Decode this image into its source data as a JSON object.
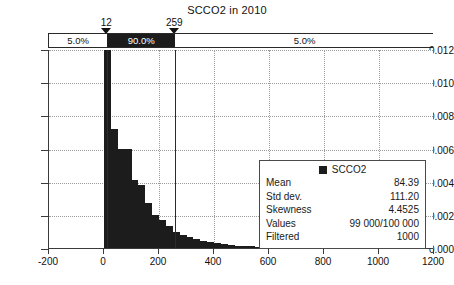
{
  "chart_data": {
    "type": "bar",
    "title": "SCCO2 in 2010",
    "xlabel": "",
    "ylabel": "",
    "xlim": [
      -200,
      1200
    ],
    "ylim": [
      0.0,
      0.012
    ],
    "grid": true,
    "legend_position": "inside-right",
    "x_ticks": [
      "-200",
      "0",
      "200",
      "400",
      "600",
      "800",
      "1000",
      "1200"
    ],
    "x_tick_values": [
      -200,
      0,
      200,
      400,
      600,
      800,
      1000,
      1200
    ],
    "y_ticks": [
      "0.000",
      "0.002",
      "0.004",
      "0.006",
      "0.008",
      "0.010",
      "0.012"
    ],
    "y_tick_values": [
      0.0,
      0.002,
      0.004,
      0.006,
      0.008,
      0.01,
      0.012
    ],
    "series_name": "SCCO2",
    "bin_width": 25,
    "bins": [
      {
        "x0": 0,
        "x1": 25,
        "value": 0.0122
      },
      {
        "x0": 25,
        "x1": 50,
        "value": 0.0072
      },
      {
        "x0": 50,
        "x1": 75,
        "value": 0.006
      },
      {
        "x0": 75,
        "x1": 100,
        "value": 0.006
      },
      {
        "x0": 100,
        "x1": 125,
        "value": 0.0041
      },
      {
        "x0": 125,
        "x1": 150,
        "value": 0.0038
      },
      {
        "x0": 150,
        "x1": 175,
        "value": 0.0027
      },
      {
        "x0": 175,
        "x1": 200,
        "value": 0.002
      },
      {
        "x0": 200,
        "x1": 225,
        "value": 0.0017
      },
      {
        "x0": 225,
        "x1": 250,
        "value": 0.0013
      },
      {
        "x0": 250,
        "x1": 275,
        "value": 0.00095
      },
      {
        "x0": 275,
        "x1": 300,
        "value": 0.0008
      },
      {
        "x0": 300,
        "x1": 325,
        "value": 0.00066
      },
      {
        "x0": 325,
        "x1": 350,
        "value": 0.00054
      },
      {
        "x0": 350,
        "x1": 375,
        "value": 0.00044
      },
      {
        "x0": 375,
        "x1": 400,
        "value": 0.00036
      },
      {
        "x0": 400,
        "x1": 425,
        "value": 0.00028
      },
      {
        "x0": 425,
        "x1": 450,
        "value": 0.00022
      },
      {
        "x0": 450,
        "x1": 475,
        "value": 0.00018
      },
      {
        "x0": 475,
        "x1": 500,
        "value": 0.00015
      },
      {
        "x0": 500,
        "x1": 525,
        "value": 0.00012
      },
      {
        "x0": 525,
        "x1": 550,
        "value": 0.0001
      },
      {
        "x0": 550,
        "x1": 575,
        "value": 8e-05
      },
      {
        "x0": 575,
        "x1": 600,
        "value": 7e-05
      },
      {
        "x0": 600,
        "x1": 625,
        "value": 6e-05
      },
      {
        "x0": 625,
        "x1": 650,
        "value": 5e-05
      },
      {
        "x0": 650,
        "x1": 675,
        "value": 4e-05
      },
      {
        "x0": 675,
        "x1": 700,
        "value": 4e-05
      },
      {
        "x0": 700,
        "x1": 725,
        "value": 3e-05
      },
      {
        "x0": 725,
        "x1": 750,
        "value": 2e-05
      },
      {
        "x0": 750,
        "x1": 775,
        "value": 3e-05
      },
      {
        "x0": 775,
        "x1": 800,
        "value": 2e-05
      },
      {
        "x0": 800,
        "x1": 825,
        "value": 3e-05
      },
      {
        "x0": 825,
        "x1": 850,
        "value": 1e-05
      }
    ],
    "percentile_bar": {
      "markers": [
        {
          "label": "12",
          "value": 12
        },
        {
          "label": "259",
          "value": 259
        }
      ],
      "segments": [
        {
          "label": "5.0%",
          "from": -200,
          "to": 12,
          "style": "light"
        },
        {
          "label": "90.0%",
          "from": 12,
          "to": 259,
          "style": "dark"
        },
        {
          "label": "5.0%",
          "from": 259,
          "to": 1200,
          "style": "light"
        }
      ]
    },
    "legend": {
      "title": "SCCO2",
      "swatch_color": "#1c1c1c",
      "rows": [
        {
          "key": "Mean",
          "value": "84.39"
        },
        {
          "key": "Std dev.",
          "value": "111.20"
        },
        {
          "key": "Skewness",
          "value": "4.4525"
        },
        {
          "key": "Values",
          "value": "99 000/100 000"
        },
        {
          "key": "Filtered",
          "value": "1000"
        }
      ]
    }
  },
  "colors": {
    "bar": "#1c1c1c",
    "axis": "#3a3a3a",
    "grid": "#9b9b9b",
    "background": "#ffffff"
  }
}
